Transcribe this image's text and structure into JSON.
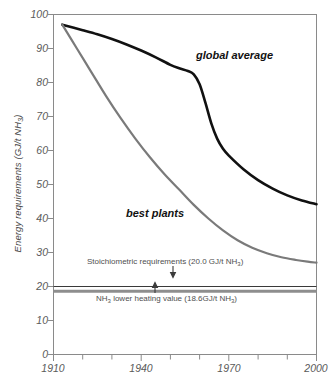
{
  "chart_data": {
    "type": "line",
    "title": "",
    "xlabel": "",
    "ylabel": "Energy requirements (GJ/t NH3)",
    "ylabel_parts": {
      "pre": "Energy requirements (GJ/t NH",
      "sub": "3",
      "post": ")"
    },
    "xlim": [
      1910,
      2000
    ],
    "ylim": [
      0,
      100
    ],
    "grid": false,
    "legend_position": "inline-annotations",
    "x_ticks_major": [
      1910,
      1940,
      1970,
      2000
    ],
    "x_ticks_minor": [
      1920,
      1930,
      1950,
      1960,
      1980,
      1990
    ],
    "x_tick_labels": [
      "1910",
      "1940",
      "1970",
      "2000"
    ],
    "y_ticks": [
      0,
      10,
      20,
      30,
      40,
      50,
      60,
      70,
      80,
      90,
      100
    ],
    "y_tick_labels": [
      "0",
      "10",
      "20",
      "30",
      "40",
      "50",
      "60",
      "70",
      "80",
      "90",
      "100"
    ],
    "series": [
      {
        "name": "global average",
        "color": "#111111",
        "width": 2.6,
        "x": [
          1913,
          1920,
          1925,
          1930,
          1935,
          1940,
          1945,
          1950,
          1953,
          1956,
          1958,
          1960,
          1962,
          1964,
          1966,
          1968,
          1970,
          1975,
          1980,
          1985,
          1990,
          1995,
          2000
        ],
        "y": [
          97.0,
          95.4,
          94.2,
          92.8,
          91.2,
          89.4,
          87.4,
          85.2,
          84.2,
          83.4,
          82.4,
          79.5,
          74.0,
          68.0,
          63.5,
          60.5,
          58.5,
          54.5,
          51.3,
          48.8,
          46.8,
          45.3,
          44.2
        ]
      },
      {
        "name": "best plants",
        "color": "#7a7a7a",
        "width": 2.2,
        "x": [
          1913,
          1918,
          1923,
          1928,
          1933,
          1938,
          1943,
          1948,
          1953,
          1958,
          1963,
          1968,
          1973,
          1978,
          1983,
          1988,
          1993,
          1997,
          2000
        ],
        "y": [
          97.0,
          90.0,
          83.0,
          76.0,
          69.5,
          63.5,
          58.0,
          53.0,
          48.5,
          44.0,
          40.0,
          36.5,
          33.6,
          31.4,
          29.8,
          28.6,
          27.8,
          27.3,
          27.0
        ]
      }
    ],
    "reference_lines": [
      {
        "name": "stoichiometric-requirements",
        "value": 20.0,
        "label": "Stoichiometric requirements (20.0 GJ/t NH3)",
        "label_parts": {
          "pre": "Stoichiometric requirements (20.0 GJ/t NH",
          "sub": "3",
          "post": ")"
        },
        "color": "#3a3a3a",
        "width": 1.2,
        "arrow": "down"
      },
      {
        "name": "nh3-lower-heating-value",
        "value": 18.6,
        "label": "NH3 lower heating value (18.6GJ/t NH3)",
        "label_parts": {
          "pre": "NH",
          "sub1": "3",
          "mid": " lower heating value (18.6GJ/t NH",
          "sub2": "3",
          "post": ")"
        },
        "color": "#8e8e8e",
        "width": 3.0,
        "arrow": "up"
      }
    ],
    "annotations": [
      {
        "name": "global-average-label",
        "text": "global average",
        "x": 1964,
        "y": 84
      },
      {
        "name": "best-plants-label",
        "text": "best plants",
        "x": 1943,
        "y": 41
      }
    ]
  },
  "axes": {
    "frame_color": "#8a8a8a",
    "tick_color": "#8a8a8a"
  }
}
